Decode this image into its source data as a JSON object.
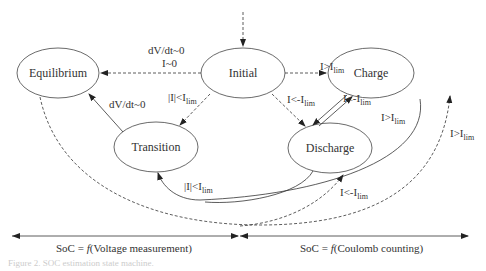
{
  "diagram": {
    "title": "SoC estimation state machine",
    "states": [
      {
        "id": "equilibrium",
        "label": "Equilibrium"
      },
      {
        "id": "initial",
        "label": "Initial"
      },
      {
        "id": "charge",
        "label": "Charge"
      },
      {
        "id": "transition",
        "label": "Transition"
      },
      {
        "id": "discharge",
        "label": "Discharge"
      }
    ],
    "transitions": [
      {
        "from": "initial",
        "to": "equilibrium",
        "style": "dashed",
        "label_line1": "dV/dt~0",
        "label_line2": "I~0"
      },
      {
        "from": "initial",
        "to": "charge",
        "style": "dashed",
        "label": "I>I",
        "label_sub": "lim"
      },
      {
        "from": "initial",
        "to": "transition",
        "style": "dashed",
        "label": "|I|<I",
        "label_sub": "lim"
      },
      {
        "from": "initial",
        "to": "discharge",
        "style": "dashed",
        "label": "I<-I",
        "label_sub": "lim"
      },
      {
        "from": "transition",
        "to": "equilibrium",
        "style": "solid",
        "label": "dV/dt~0"
      },
      {
        "from": "charge",
        "to": "discharge",
        "style": "solid",
        "label": "I<-I",
        "label_sub": "lim"
      },
      {
        "from": "discharge",
        "to": "charge",
        "style": "solid",
        "label": "I>I",
        "label_sub": "lim"
      },
      {
        "from": "charge",
        "to": "transition",
        "style": "solid",
        "label": "|I|<I",
        "label_sub": "lim"
      },
      {
        "from": "discharge",
        "to": "transition",
        "style": "solid"
      },
      {
        "from": "equilibrium",
        "to": "charge",
        "style": "dashed",
        "label": "I>I",
        "label_sub": "lim"
      },
      {
        "from": "equilibrium",
        "to": "discharge",
        "style": "dashed",
        "label": "I<-I",
        "label_sub": "lim"
      }
    ],
    "regions": {
      "left": "SoC = f(Voltage measurement)",
      "left_prefix": "SoC =",
      "left_func": "f",
      "left_arg": "(Voltage measurement)",
      "right_prefix": "SoC =",
      "right_func": "f",
      "right_arg": "(Coulomb counting)"
    },
    "figure_caption": "Figure 2. SOC estimation state machine."
  }
}
